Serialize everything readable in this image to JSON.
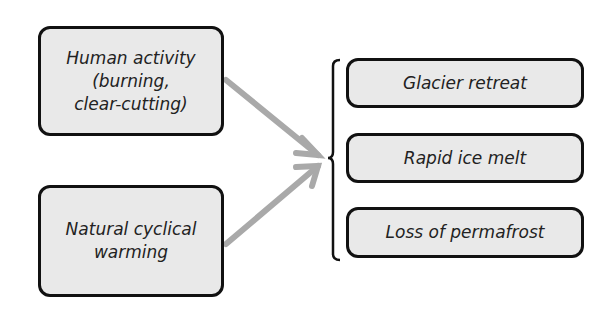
{
  "causes": [
    {
      "label": "Human activity\n(burning,\nclear-cutting)"
    },
    {
      "label": "Natural cyclical\nwarming"
    }
  ],
  "effects": [
    {
      "label": "Glacier retreat"
    },
    {
      "label": "Rapid ice melt"
    },
    {
      "label": "Loss of permafrost"
    }
  ],
  "colors": {
    "box_fill": "#e9e9e9",
    "border": "#111111",
    "arrow": "#a9a9a9"
  }
}
